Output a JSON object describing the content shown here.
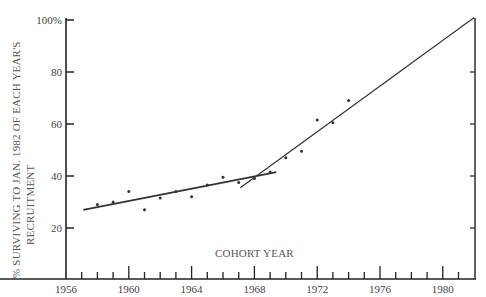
{
  "chart_data": {
    "type": "scatter",
    "title": "",
    "xlabel": "COHORT YEAR",
    "ylabel_line1": "% SURVIVING TO JAN. 1982 OF EACH YEAR'S",
    "ylabel_line2": "RECRUITMENT",
    "xlim": [
      1956,
      1982
    ],
    "ylim": [
      0,
      100
    ],
    "x_ticks": [
      1956,
      1960,
      1964,
      1968,
      1972,
      1976,
      1980
    ],
    "x_tick_labels": [
      "1956",
      "1960",
      "1964",
      "1968",
      "1972",
      "1976",
      "1980"
    ],
    "y_ticks": [
      20,
      40,
      60,
      80,
      100
    ],
    "y_tick_labels": [
      "20",
      "40",
      "60",
      "80",
      "100%"
    ],
    "grid": false,
    "series": [
      {
        "name": "observed",
        "x": [
          1958,
          1959,
          1960,
          1961,
          1962,
          1963,
          1964,
          1965,
          1966,
          1967,
          1968,
          1969,
          1970,
          1971,
          1972,
          1973,
          1974
        ],
        "y": [
          29,
          30,
          34,
          27,
          31.5,
          34,
          32,
          36.5,
          39.5,
          37.5,
          39,
          41.5,
          47,
          49.5,
          61.5,
          60.5,
          69
        ]
      }
    ],
    "fit_lines": [
      {
        "name": "early-trend",
        "x": [
          1957.1,
          1969.4
        ],
        "y": [
          27,
          41.5
        ]
      },
      {
        "name": "late-trend",
        "x": [
          1967.1,
          1982
        ],
        "y": [
          35.5,
          101
        ]
      }
    ]
  }
}
